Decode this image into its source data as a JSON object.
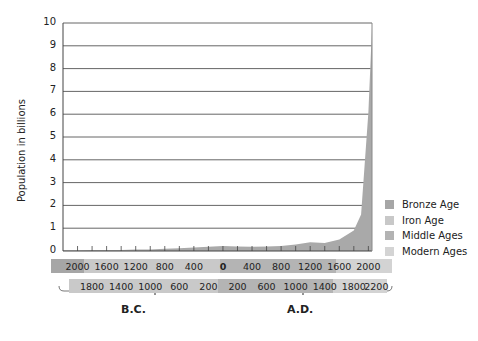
{
  "chart_data": {
    "type": "area",
    "title": "",
    "xlabel": "",
    "ylabel": "Population in billions",
    "ylim": [
      0,
      10
    ],
    "yticks": [
      0,
      1,
      2,
      3,
      4,
      5,
      6,
      7,
      8,
      9,
      10
    ],
    "grid": true,
    "x": [
      -2200,
      -2000,
      -1800,
      -1600,
      -1400,
      -1200,
      -1000,
      -800,
      -600,
      -400,
      -200,
      0,
      200,
      400,
      600,
      800,
      1000,
      1200,
      1400,
      1600,
      1800,
      1900,
      2000,
      2050
    ],
    "series": [
      {
        "name": "World population (billions)",
        "values": [
          0.03,
          0.03,
          0.04,
          0.05,
          0.05,
          0.06,
          0.07,
          0.1,
          0.12,
          0.15,
          0.19,
          0.22,
          0.2,
          0.19,
          0.2,
          0.22,
          0.28,
          0.38,
          0.35,
          0.5,
          0.9,
          1.6,
          6.1,
          9.8
        ]
      }
    ],
    "legend": [
      "Bronze Age",
      "Iron Age",
      "Middle Ages",
      "Modern Ages"
    ],
    "legend_position": "right",
    "xaxis_bands": {
      "top_row": [
        "2000",
        "1600",
        "1200",
        "800",
        "400",
        "0",
        "400",
        "800",
        "1200",
        "1600",
        "2000"
      ],
      "bottom_row": [
        "1800",
        "1400",
        "1000",
        "600",
        "200",
        "200",
        "600",
        "1000",
        "1400",
        "1800",
        "2200"
      ]
    },
    "era_labels": [
      "B.C.",
      "A.D."
    ]
  },
  "colors": {
    "area": "#a9a9a9",
    "bronze": "#a6a6a6",
    "iron": "#c8c8c8",
    "middle": "#b3b3b3",
    "modern": "#d4d4d4"
  }
}
